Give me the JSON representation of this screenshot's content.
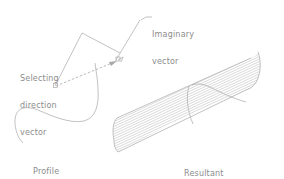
{
  "figure": {
    "type": "technical-illustration",
    "background": "#ffffff",
    "line_color": "#a8a8a8",
    "text_color": "#8c8c8c"
  },
  "labels": {
    "selecting_direction_vector": {
      "line1": "Selecting",
      "line2": "direction",
      "line3": "vector"
    },
    "imaginary_vector": {
      "line1": "Imaginary",
      "line2": "vector"
    },
    "profile_curve": {
      "line1": "Profile",
      "line2": "curve"
    },
    "resultant_surface": {
      "line1": "Resultant",
      "line2": "surface"
    }
  },
  "elements": {
    "profile_curve": "freeform S-shaped open curve",
    "direction_polyline": "two-segment polyline with peak near (82,33)",
    "imaginary_vector": "dashed arrow from lower-left pick point to upper-right pick point",
    "resultant_surface": "hatched tabulated (extruded) surface with curved end edges",
    "pick_markers": [
      "small square at start point",
      "small square at end point"
    ]
  }
}
